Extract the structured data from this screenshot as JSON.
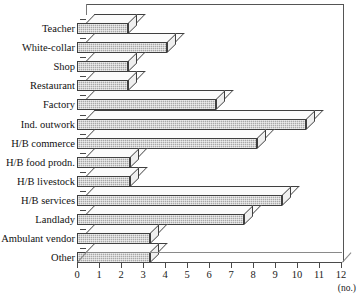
{
  "chart_data": {
    "type": "bar",
    "orientation": "horizontal",
    "style": "3d",
    "title": "",
    "xlabel": "(no.)",
    "ylabel": "",
    "xlim": [
      0,
      12
    ],
    "xticks": [
      0,
      1,
      2,
      3,
      4,
      5,
      6,
      7,
      8,
      9,
      10,
      11,
      12
    ],
    "grid": false,
    "legend": false,
    "categories": [
      "Teacher",
      "White-collar",
      "Shop",
      "Restaurant",
      "Factory",
      "Ind. outwork",
      "H/B commerce",
      "H/B food prodn.",
      "H/B livestock",
      "H/B services",
      "Landlady",
      "Ambulant vendor",
      "Other"
    ],
    "values": [
      2.3,
      4.1,
      2.3,
      2.3,
      6.3,
      10.4,
      8.2,
      2.4,
      2.4,
      9.3,
      7.6,
      3.3,
      3.3
    ],
    "colors": {
      "bar_face": "#a8a8a8",
      "bar_top": "#fbfbfb",
      "bar_side": "#efefef",
      "outline": "#3f3f3f",
      "axis": "#4a4a4a"
    }
  }
}
